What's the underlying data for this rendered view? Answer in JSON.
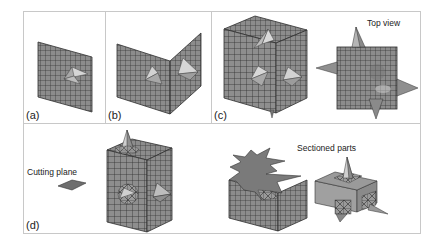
{
  "figure": {
    "panels": [
      {
        "id": "a",
        "label": "(a)",
        "description": "Single meshed plane with one pyramidal spike"
      },
      {
        "id": "b",
        "label": "(b)",
        "description": "Two orthogonal meshed planes each with a spike"
      },
      {
        "id": "c",
        "label": "(c)",
        "description": "Meshed cube with spikes on faces, plus top view",
        "annotation": "Top view"
      },
      {
        "id": "d",
        "label": "(d)",
        "description": "Cube with cutting plane and resulting sectioned parts",
        "annotations": [
          "Cutting plane",
          "Sectioned parts"
        ]
      }
    ],
    "colors": {
      "background": "#ffffff",
      "frame": "#c8c8c8",
      "mesh_fill": "#8c8c8c",
      "mesh_line": "#2e2e2e",
      "spike_light": "#d8d8d8",
      "spike_dark": "#7a7a7a",
      "section_face": "#777777",
      "section_side": "#9c9c9c"
    }
  }
}
